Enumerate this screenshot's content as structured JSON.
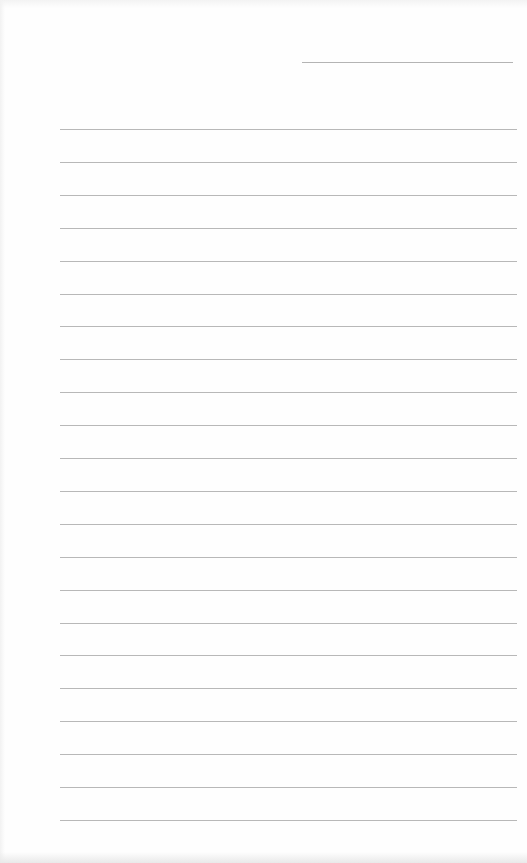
{
  "page": {
    "type": "lined-notebook-page",
    "background_color": "#fefefe",
    "line_color": "#b8b8b8",
    "header_line": {
      "label": "date-line",
      "text": "",
      "x_start": 302,
      "x_end": 513,
      "y": 62
    },
    "ruled_lines": {
      "count": 22,
      "x_start": 60,
      "x_end": 517,
      "first_y": 129,
      "spacing": 32.9
    },
    "lines": [
      "",
      "",
      "",
      "",
      "",
      "",
      "",
      "",
      "",
      "",
      "",
      "",
      "",
      "",
      "",
      "",
      "",
      "",
      "",
      "",
      "",
      ""
    ]
  }
}
